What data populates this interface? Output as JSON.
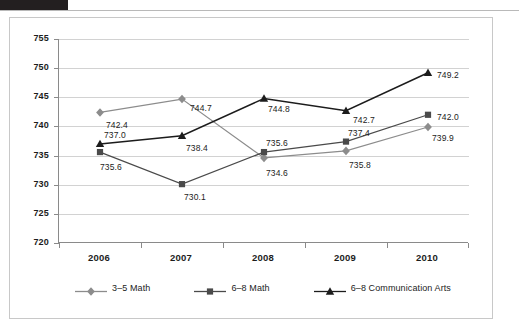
{
  "chart_data": {
    "type": "line",
    "title": "",
    "xlabel": "",
    "ylabel": "",
    "categories": [
      "2006",
      "2007",
      "2008",
      "2009",
      "2010"
    ],
    "ylim": [
      720,
      755
    ],
    "yticks": [
      720,
      725,
      730,
      735,
      740,
      745,
      750,
      755
    ],
    "grid": true,
    "legend_position": "bottom",
    "series": [
      {
        "name": "3–5 Math",
        "marker": "diamond",
        "color": "#8c8c8c",
        "values": [
          742.4,
          744.7,
          734.6,
          735.8,
          739.9
        ],
        "labels": [
          "742.4",
          "744.7",
          "734.6",
          "735.8",
          "739.9"
        ]
      },
      {
        "name": "6–8 Math",
        "marker": "square",
        "color": "#4a4a4a",
        "values": [
          735.6,
          730.1,
          735.6,
          737.4,
          742.0
        ],
        "labels": [
          "735.6",
          "730.1",
          "735.6",
          "737.4",
          "742.0"
        ]
      },
      {
        "name": "6–8 Communication Arts",
        "marker": "triangle",
        "color": "#1c1c1c",
        "values": [
          737.0,
          738.4,
          744.8,
          742.7,
          749.2
        ],
        "labels": [
          "737.0",
          "738.4",
          "744.8",
          "742.7",
          "749.2"
        ]
      }
    ]
  },
  "axis": {
    "y_tick_labels": [
      "755",
      "750",
      "745",
      "740",
      "735",
      "730",
      "725",
      "720"
    ],
    "x_tick_labels": [
      "2006",
      "2007",
      "2008",
      "2009",
      "2010"
    ]
  },
  "legend": {
    "items": [
      {
        "label": "3–5 Math"
      },
      {
        "label": "6–8 Math"
      },
      {
        "label": "6–8 Communication Arts"
      }
    ]
  }
}
